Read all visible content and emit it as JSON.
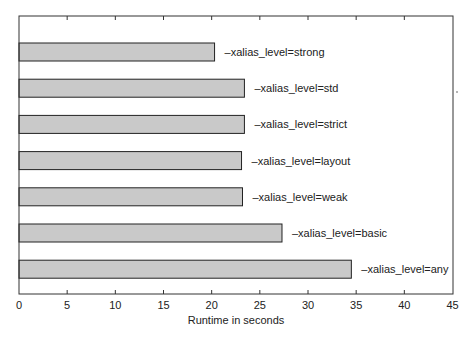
{
  "chart_data": {
    "type": "bar",
    "orientation": "horizontal",
    "title": "",
    "xlabel": "Runtime in seconds",
    "ylabel": "",
    "xlim": [
      0,
      45
    ],
    "xticks": [
      0,
      5,
      10,
      15,
      20,
      25,
      30,
      35,
      40,
      45
    ],
    "grid": false,
    "legend": null,
    "categories": [
      "-xalias_level=strong",
      "-xalias_level=std",
      "-xalias_level=strict",
      "-xalias_level=layout",
      "-xalias_level=weak",
      "-xalias_level=basic",
      "-xalias_level=any"
    ],
    "values": [
      20.3,
      23.4,
      23.4,
      23.1,
      23.2,
      27.3,
      34.5
    ],
    "bar_fill": "#c9c9c9",
    "bar_stroke": "#222222"
  },
  "labels": {
    "xaxis_title": "Runtime in seconds"
  }
}
